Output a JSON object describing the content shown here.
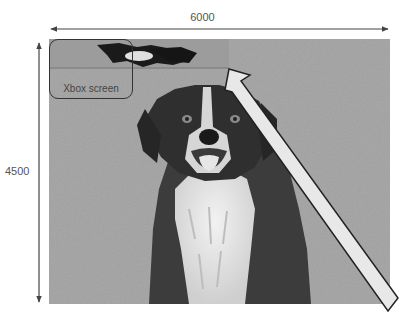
{
  "diagram": {
    "width_dimension": {
      "label": "6000",
      "orientation": "horizontal"
    },
    "height_dimension": {
      "label": "4500",
      "orientation": "vertical"
    },
    "region_callout": {
      "label": "Xbox screen"
    },
    "photo": {
      "subject": "border collie dog sitting on grass",
      "tone": "grayscale"
    },
    "pointer_arrow": {
      "direction": "up-left",
      "fill": "#e8e8e8",
      "stroke": "#222222"
    }
  },
  "colors": {
    "background": "#ffffff",
    "grass": "#a8a8a8",
    "dimension_line": "#444444",
    "label_text": "#555555"
  }
}
